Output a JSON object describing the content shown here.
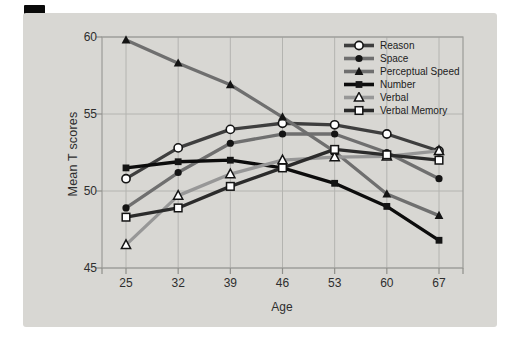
{
  "figure": {
    "x_axis_label": "Age",
    "y_axis_label": "Mean T scores"
  },
  "chart_data": {
    "type": "line",
    "x": [
      25,
      32,
      39,
      46,
      53,
      60,
      67
    ],
    "xlabel": "Age",
    "ylabel": "Mean T scores",
    "ylim": [
      45,
      60
    ],
    "yticks": [
      45,
      50,
      55,
      60
    ],
    "grid": true,
    "legend_position": "top-right-inside",
    "series": [
      {
        "name": "Reason",
        "values": [
          50.8,
          52.8,
          54.0,
          54.4,
          54.3,
          53.7,
          52.6
        ],
        "color": "#3e3e3e",
        "marker": "circle-open"
      },
      {
        "name": "Space",
        "values": [
          48.9,
          51.2,
          53.1,
          53.7,
          53.7,
          52.5,
          50.8
        ],
        "color": "#6f6f6f",
        "marker": "circle-filled"
      },
      {
        "name": "Perceptual Speed",
        "values": [
          59.8,
          58.3,
          56.9,
          54.8,
          52.55,
          49.8,
          48.4
        ],
        "color": "#6f6f6f",
        "marker": "triangle-filled"
      },
      {
        "name": "Number",
        "values": [
          51.5,
          51.9,
          52.0,
          51.5,
          50.5,
          49.0,
          46.8
        ],
        "color": "#0c0c0c",
        "marker": "square-filled"
      },
      {
        "name": "Verbal",
        "values": [
          46.5,
          49.7,
          51.1,
          52.0,
          52.2,
          52.25,
          52.6
        ],
        "color": "#979797",
        "marker": "triangle-open"
      },
      {
        "name": "Verbal Memory",
        "values": [
          48.3,
          48.9,
          50.3,
          51.5,
          52.7,
          52.35,
          52.0
        ],
        "color": "#2b2b2b",
        "marker": "square-open"
      }
    ]
  },
  "colors": {
    "page_bg": "#ffffff",
    "panel_bg": "#d8d7d3",
    "gridline": "#b4b4b0",
    "plot_border": "#9c9c98",
    "tick": "#8f8f8b",
    "text": "#2e2e2e",
    "marker_stroke": "#141414",
    "marker_open_fill": "#ffffff",
    "corner_bar": "#0a0a0a"
  }
}
